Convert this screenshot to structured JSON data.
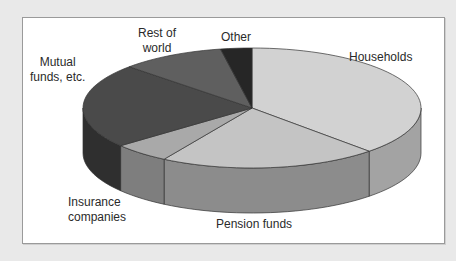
{
  "chart_data": {
    "type": "pie",
    "style": "3d-exploded-none",
    "title": "",
    "categories": [
      "Households",
      "Pension funds",
      "Insurance companies",
      "Mutual funds, etc.",
      "Rest of world",
      "Other"
    ],
    "values": [
      38,
      21,
      5.5,
      23,
      10,
      3
    ],
    "unit": "% (estimated from slice angles; no values printed)",
    "colors": [
      "#d2d2d2",
      "#c4c4c4",
      "#a9a9a9",
      "#4a4a4a",
      "#5f5f5f",
      "#262626"
    ],
    "side_colors": [
      "#a3a3a3",
      "#8c8c8c",
      "#7e7e7e",
      "#2f2f2f",
      "#444444",
      "#151515"
    ],
    "start_angle_deg": 90,
    "direction": "clockwise",
    "legend": "none (direct labels)"
  },
  "labels": {
    "households": "Households",
    "pension": "Pension funds",
    "insurance_1": "Insurance",
    "insurance_2": "companies",
    "mutual_1": "Mutual",
    "mutual_2": "funds, etc.",
    "rest_1": "Rest of",
    "rest_2": "world",
    "other": "Other"
  }
}
